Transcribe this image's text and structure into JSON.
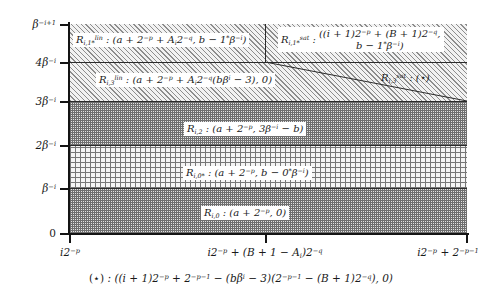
{
  "figure": {
    "type": "region-partition-diagram",
    "caption": "(⋆) : ((i + 1)2−p + 2−p−1 − (bβi − 3)(2−p−1 − (B + 1)2−q), 0)"
  },
  "axes": {
    "y_ticks": [
      {
        "label": "β−i+1",
        "value": "beta^{-i+1}",
        "y_px": 24
      },
      {
        "label": "4β−i",
        "value": "4beta^{-i}",
        "y_px": 62
      },
      {
        "label": "3β−i",
        "value": "3beta^{-i}",
        "y_px": 101
      },
      {
        "label": "2β−i",
        "value": "2beta^{-i}",
        "y_px": 145
      },
      {
        "label": "β−i",
        "value": "beta^{-i}",
        "y_px": 188
      },
      {
        "label": "0",
        "value": "0",
        "y_px": 233
      }
    ],
    "x_ticks": [
      {
        "label": "i2−p",
        "value": "i*2^{-p}",
        "x_px": 70
      },
      {
        "label": "i2−p + (B + 1 − Ai)2−q",
        "value": "i*2^{-p}+(B+1-A_i)2^{-q}",
        "x_px": 265
      },
      {
        "label": "i2−p + 2−p−1",
        "value": "i*2^{-p}+2^{-p-1}",
        "x_px": 467
      }
    ]
  },
  "regions": [
    {
      "id": "R_i_1star_lin",
      "name": "R lin i,1*",
      "label": "Rlin i,1* : (a + 2−p + Ai2−q, b − 1*β−i)",
      "band": "top",
      "texture": "diagonal-hatch"
    },
    {
      "id": "R_i_1star_sat",
      "name": "R sat i,1*",
      "label": "Rsat i,1* : ((i + 1)2−p + (B + 1)2−q, b − 1*β−i)",
      "band": "top-right",
      "texture": "diagonal-hatch"
    },
    {
      "id": "R_i_3_lin",
      "name": "R lin i,3",
      "label": "Rlin i,3 : (a + 2−p + Ai2−q(bβi − 3), 0)",
      "band": "second",
      "texture": "diagonal-hatch"
    },
    {
      "id": "R_i_3_sat",
      "name": "R sat i,3",
      "label": "Rsat i,3 : (⋆)",
      "band": "second-right",
      "texture": "diagonal-hatch"
    },
    {
      "id": "R_i_2",
      "name": "R i,2",
      "label": "Ri,2 : (a + 2−p, 3β−i − b)",
      "band": "third",
      "texture": "dense-checker"
    },
    {
      "id": "R_i_0star",
      "name": "R i,0*",
      "label": "Ri,0* : (a + 2−p, b − 0*β−i)",
      "band": "fourth",
      "texture": "open-grid"
    },
    {
      "id": "R_i_0",
      "name": "R i,0",
      "label": "Ri,0 : (a + 2−p, 0)",
      "band": "bottom",
      "texture": "dense-checker"
    }
  ],
  "colors": {
    "ink": "#141414",
    "hatch": "#8d8d8d",
    "checker": "#6f6f6f",
    "grid": "#767676",
    "paper": "#ffffff"
  }
}
